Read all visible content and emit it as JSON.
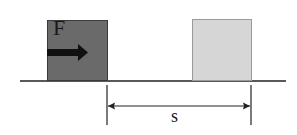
{
  "diagram": {
    "type": "physics-work-diagram",
    "force_label": "F",
    "displacement_label": "s",
    "colors": {
      "initial_block": "#6a6a6a",
      "initial_block_border": "#3a3a3a",
      "final_block": "#d6d6d6",
      "final_block_border": "#9a9a9a",
      "ground": "#222222",
      "arrow": "#111111"
    },
    "elements": [
      {
        "name": "initial-block",
        "description": "dark block at start position with force arrow"
      },
      {
        "name": "final-block",
        "description": "light block at final position"
      },
      {
        "name": "ground-line",
        "description": "horizontal surface"
      },
      {
        "name": "displacement-arrow",
        "description": "double-headed arrow between tick marks labeled s"
      }
    ]
  }
}
